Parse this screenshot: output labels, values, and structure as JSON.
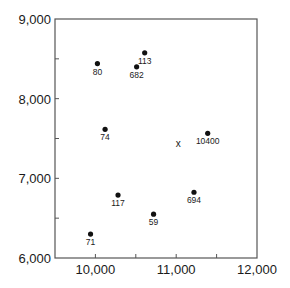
{
  "chart_data": {
    "type": "scatter",
    "title": "",
    "xlabel": "",
    "ylabel": "",
    "xlim": [
      9500,
      12000
    ],
    "ylim": [
      6000,
      9000
    ],
    "grid": false,
    "legend": null,
    "x_ticks": [
      10000,
      11000,
      12000
    ],
    "x_tick_labels": [
      "10,000",
      "11,000",
      "12,000"
    ],
    "x_minor_ticks": [
      10500,
      11500
    ],
    "y_ticks": [
      6000,
      7000,
      8000,
      9000
    ],
    "y_tick_labels": [
      "6,000",
      "7,000",
      "8,000",
      "9,000"
    ],
    "y_minor_ticks": [
      6500,
      7500,
      8500
    ],
    "points": [
      {
        "label": "80",
        "x": 10025,
        "y": 8440
      },
      {
        "label": "113",
        "x": 10610,
        "y": 8575
      },
      {
        "label": "682",
        "x": 10510,
        "y": 8400
      },
      {
        "label": "74",
        "x": 10120,
        "y": 7615
      },
      {
        "label": "10400",
        "x": 11390,
        "y": 7565
      },
      {
        "label": "117",
        "x": 10280,
        "y": 6790
      },
      {
        "label": "694",
        "x": 11220,
        "y": 6825
      },
      {
        "label": "59",
        "x": 10720,
        "y": 6550
      },
      {
        "label": "71",
        "x": 9940,
        "y": 6300
      }
    ],
    "annotations": [
      {
        "text": "x",
        "x": 11025,
        "y": 7440,
        "kind": "centroid-marker"
      }
    ]
  },
  "colors": {
    "axis": "#555555",
    "point": "#111111",
    "text": "#1a1a1a",
    "background": "#ffffff"
  }
}
